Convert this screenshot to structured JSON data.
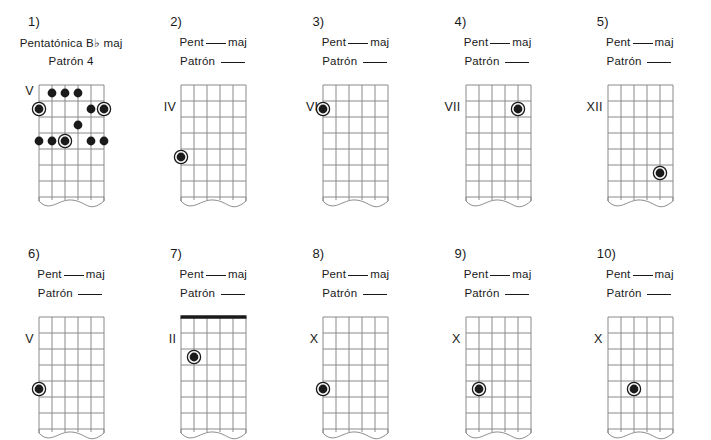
{
  "document": {
    "kind": "guitar-pentatonic-scale-worksheet",
    "language": "es",
    "background_color": "#ffffff",
    "ink_color": "#1a1a1a",
    "grid_color": "#8a8a8a"
  },
  "labels": {
    "title_prefix": "Pent",
    "title_suffix": "maj",
    "subtitle_prefix": "Patrón",
    "flat_symbol": "♭"
  },
  "fretboard_geometry": {
    "strings": 6,
    "frets": 8,
    "string_spacing": 13,
    "fret_spacing": 16,
    "width": 65,
    "height": 128,
    "dot_radius": 4.4,
    "root_ring_radius": 6.6
  },
  "diagrams": [
    {
      "index": "1)",
      "title_full": "Pentatónica B♭ maj",
      "title_is_filled": true,
      "title_root": "B",
      "title_accidental": "♭",
      "subtitle_full": "Patrón 4",
      "subtitle_is_filled": true,
      "subtitle_value": "4",
      "position_marker": "V",
      "position_marker_fret": 1,
      "has_nut": false,
      "notes": [
        {
          "string": 6,
          "fret": 2,
          "root": true
        },
        {
          "string": 5,
          "fret": 1,
          "root": false
        },
        {
          "string": 4,
          "fret": 1,
          "root": false
        },
        {
          "string": 3,
          "fret": 1,
          "root": false
        },
        {
          "string": 3,
          "fret": 3,
          "root": false
        },
        {
          "string": 2,
          "fret": 2,
          "root": false
        },
        {
          "string": 1,
          "fret": 2,
          "root": true
        },
        {
          "string": 6,
          "fret": 4,
          "root": false
        },
        {
          "string": 5,
          "fret": 4,
          "root": false
        },
        {
          "string": 4,
          "fret": 4,
          "root": true
        },
        {
          "string": 2,
          "fret": 4,
          "root": false
        },
        {
          "string": 1,
          "fret": 4,
          "root": false
        }
      ]
    },
    {
      "index": "2)",
      "title_full": "Pent___maj",
      "title_is_filled": false,
      "subtitle_full": "Patrón ___",
      "subtitle_is_filled": false,
      "position_marker": "IV",
      "position_marker_fret": 2,
      "has_nut": false,
      "notes": [
        {
          "string": 6,
          "fret": 5,
          "root": true
        }
      ]
    },
    {
      "index": "3)",
      "title_full": "Pent___maj",
      "title_is_filled": false,
      "subtitle_full": "Patrón ___",
      "subtitle_is_filled": false,
      "position_marker": "VI",
      "position_marker_fret": 2,
      "has_nut": false,
      "notes": [
        {
          "string": 6,
          "fret": 2,
          "root": true
        }
      ]
    },
    {
      "index": "4)",
      "title_full": "Pent___maj",
      "title_is_filled": false,
      "subtitle_full": "Patrón ___",
      "subtitle_is_filled": false,
      "position_marker": "VII",
      "position_marker_fret": 2,
      "has_nut": false,
      "notes": [
        {
          "string": 2,
          "fret": 2,
          "root": true
        }
      ]
    },
    {
      "index": "5)",
      "title_full": "Pent___maj",
      "title_is_filled": false,
      "subtitle_full": "Patrón ___",
      "subtitle_is_filled": false,
      "position_marker": "XII",
      "position_marker_fret": 2,
      "has_nut": false,
      "notes": [
        {
          "string": 2,
          "fret": 6,
          "root": true
        }
      ]
    },
    {
      "index": "6)",
      "title_full": "Pent___maj",
      "title_is_filled": false,
      "subtitle_full": "Patrón ___",
      "subtitle_is_filled": false,
      "position_marker": "V",
      "position_marker_fret": 2,
      "has_nut": false,
      "notes": [
        {
          "string": 6,
          "fret": 5,
          "root": true
        }
      ]
    },
    {
      "index": "7)",
      "title_full": "Pent___maj",
      "title_is_filled": false,
      "subtitle_full": "Patrón ___",
      "subtitle_is_filled": false,
      "position_marker": "II",
      "position_marker_fret": 2,
      "has_nut": true,
      "notes": [
        {
          "string": 5,
          "fret": 3,
          "root": true
        }
      ]
    },
    {
      "index": "8)",
      "title_full": "Pent___maj",
      "title_is_filled": false,
      "subtitle_full": "Patrón ___",
      "subtitle_is_filled": false,
      "position_marker": "X",
      "position_marker_fret": 2,
      "has_nut": false,
      "notes": [
        {
          "string": 6,
          "fret": 5,
          "root": true
        }
      ]
    },
    {
      "index": "9)",
      "title_full": "Pent___maj",
      "title_is_filled": false,
      "subtitle_full": "Patrón ___",
      "subtitle_is_filled": false,
      "position_marker": "X",
      "position_marker_fret": 2,
      "has_nut": false,
      "notes": [
        {
          "string": 5,
          "fret": 5,
          "root": true
        }
      ]
    },
    {
      "index": "10)",
      "title_full": "Pent___maj",
      "title_is_filled": false,
      "subtitle_full": "Patrón ___",
      "subtitle_is_filled": false,
      "position_marker": "X",
      "position_marker_fret": 2,
      "has_nut": false,
      "notes": [
        {
          "string": 4,
          "fret": 5,
          "root": true
        }
      ]
    }
  ]
}
